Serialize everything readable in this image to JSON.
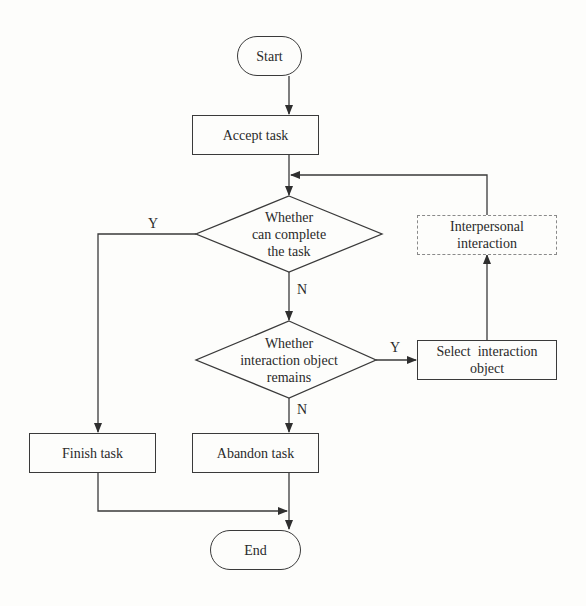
{
  "diagram": {
    "type": "flowchart",
    "nodes": {
      "start": {
        "label": "Start",
        "shape": "terminator"
      },
      "accept_task": {
        "label": "Accept task",
        "shape": "process"
      },
      "decision_complete": {
        "label_lines": [
          "Whether",
          "can complete",
          "the task"
        ],
        "shape": "decision"
      },
      "decision_remains": {
        "label_lines": [
          "Whether",
          "interaction object",
          "remains"
        ],
        "shape": "decision"
      },
      "select_object": {
        "label_lines": [
          "Select  interaction",
          "object"
        ],
        "shape": "process"
      },
      "interpersonal": {
        "label_lines": [
          "Interpersonal",
          "interaction"
        ],
        "shape": "process-dashed"
      },
      "finish_task": {
        "label": "Finish task",
        "shape": "process"
      },
      "abandon_task": {
        "label": "Abandon task",
        "shape": "process"
      },
      "end": {
        "label": "End",
        "shape": "terminator"
      }
    },
    "edge_labels": {
      "complete_yes": "Y",
      "complete_no": "N",
      "remains_yes": "Y",
      "remains_no": "N"
    },
    "edges": [
      {
        "from": "start",
        "to": "accept_task"
      },
      {
        "from": "accept_task",
        "to": "decision_complete"
      },
      {
        "from": "decision_complete",
        "to": "finish_task",
        "label": "Y"
      },
      {
        "from": "decision_complete",
        "to": "decision_remains",
        "label": "N"
      },
      {
        "from": "decision_remains",
        "to": "select_object",
        "label": "Y"
      },
      {
        "from": "decision_remains",
        "to": "abandon_task",
        "label": "N"
      },
      {
        "from": "select_object",
        "to": "interpersonal"
      },
      {
        "from": "interpersonal",
        "to": "decision_complete"
      },
      {
        "from": "finish_task",
        "to": "end"
      },
      {
        "from": "abandon_task",
        "to": "end"
      }
    ],
    "colors": {
      "stroke": "#3a3a3a",
      "dashed_stroke": "#8a8a8a",
      "background": "#fdfdfb",
      "text": "#2a2a2a"
    }
  }
}
